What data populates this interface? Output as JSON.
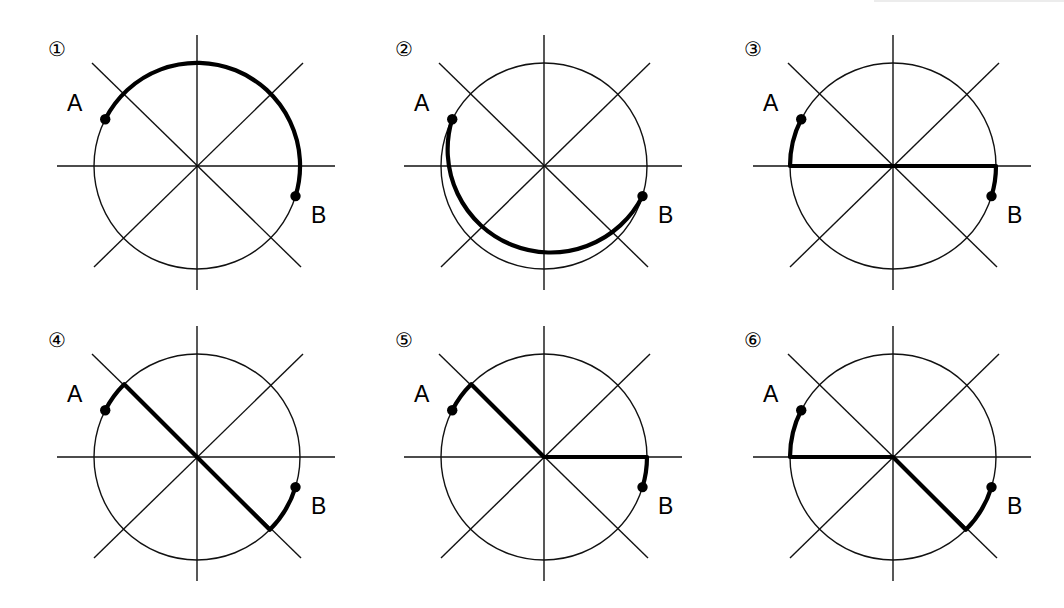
{
  "figure": {
    "labels": {
      "point_a": "A",
      "point_b": "B"
    },
    "panels": [
      {
        "number": "①",
        "path": "arc over the top from A clockwise to B"
      },
      {
        "number": "②",
        "path": "arc under the bottom from A counter-clockwise to B"
      },
      {
        "number": "③",
        "path": "short arc A to left end of horizontal diameter, along horizontal diameter to right end, short arc to B"
      },
      {
        "number": "④",
        "path": "short arc A to upper-left diagonal end, along diagonal through center to lower-right end, short arc to B"
      },
      {
        "number": "⑤",
        "path": "short arc A to upper-left diagonal end, along diagonal to center, along horizontal radius to right end, short arc to B"
      },
      {
        "number": "⑥",
        "path": "short arc A to left end of horizontal diameter, along horizontal radius to center, along diagonal to lower-right end, short arc to B"
      }
    ],
    "colors": {
      "ink": "#000000",
      "background": "#ffffff"
    }
  }
}
